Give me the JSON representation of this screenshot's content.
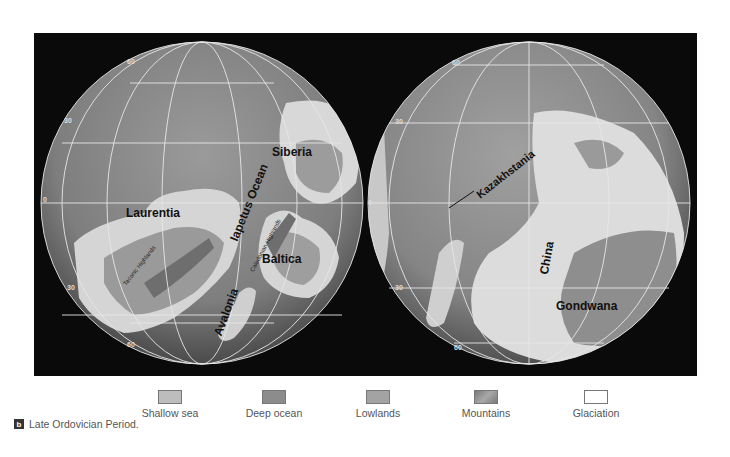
{
  "figure": {
    "panel_letter": "b",
    "caption": "Late Ordovician Period.",
    "colors": {
      "panel_background": "#0a0a0a",
      "deep_ocean": "#7a7a7a",
      "shallow_sea": "#bdbdbd",
      "lowlands": "#9b9b9b",
      "mountains": "#8a8a8a",
      "glaciation": "#ffffff",
      "graticule": "#e6e6e6"
    }
  },
  "left_globe": {
    "latitude_labels": [
      "60",
      "30",
      "0",
      "30",
      "60"
    ],
    "labels": {
      "siberia": "Siberia",
      "laurentia": "Laurentia",
      "iapetus_ocean": "Iapetus Ocean",
      "baltica": "Baltica",
      "avalonia": "Avalonia",
      "taconic_highlands": "Taconic Highlands",
      "caledonian_highlands": "Caledonian Highlands"
    }
  },
  "right_globe": {
    "latitude_labels": [
      "60",
      "30",
      "0",
      "30",
      "60"
    ],
    "labels": {
      "kazakhstania": "Kazakhstania",
      "china": "China",
      "gondwana": "Gondwana"
    }
  },
  "legend": {
    "items": [
      {
        "label": "Shallow sea",
        "color": "#bdbdbd"
      },
      {
        "label": "Deep ocean",
        "color": "#8c8c8c"
      },
      {
        "label": "Lowlands",
        "color": "#a3a3a3"
      },
      {
        "label": "Mountains",
        "color": "#8f8f8f"
      },
      {
        "label": "Glaciation",
        "color": "#ffffff"
      }
    ]
  }
}
